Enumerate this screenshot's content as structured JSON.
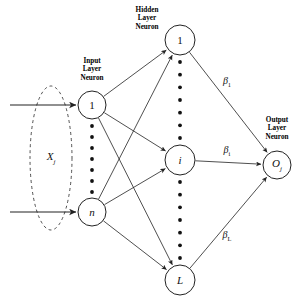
{
  "diagram": {
    "stroke_color": "#222222",
    "background": "#ffffff",
    "groups": [
      {
        "id": "input-layer",
        "label": "Input\nLayer\nNeuron",
        "x": 92,
        "y": 57
      },
      {
        "id": "hidden-layer",
        "label": "Hidden\nLayer\nNeuron",
        "x": 147,
        "y": 6
      },
      {
        "id": "output-layer",
        "label": "Output\nLayer\nNeuron",
        "x": 277,
        "y": 116
      }
    ],
    "input_nodes": [
      {
        "id": "input-node-1",
        "label": "1",
        "italic": false,
        "cx": 92,
        "cy": 105,
        "r": 14
      },
      {
        "id": "input-node-n",
        "label": "n",
        "italic": true,
        "cx": 92,
        "cy": 212,
        "r": 14
      }
    ],
    "hidden_nodes": [
      {
        "id": "hidden-node-1",
        "label": "1",
        "italic": false,
        "cx": 180,
        "cy": 40,
        "r": 15
      },
      {
        "id": "hidden-node-i",
        "label": "i",
        "italic": true,
        "cx": 180,
        "cy": 160,
        "r": 15
      },
      {
        "id": "hidden-node-L",
        "label": "L",
        "italic": true,
        "cx": 180,
        "cy": 280,
        "r": 15
      }
    ],
    "output_nodes": [
      {
        "id": "output-node-Oj",
        "label": "O",
        "sub": "j",
        "italic": true,
        "cx": 277,
        "cy": 165,
        "r": 14
      }
    ],
    "input_dots": {
      "count": 7,
      "cx": 92,
      "from_y": 126,
      "to_y": 192
    },
    "hidden_dots_upper": {
      "count": 7,
      "cx": 180,
      "from_y": 62,
      "to_y": 138
    },
    "hidden_dots_lower": {
      "count": 7,
      "cx": 180,
      "from_y": 182,
      "to_y": 258
    },
    "weights": [
      {
        "id": "beta-1",
        "base": "β",
        "sub": "1",
        "x": 227,
        "y": 81
      },
      {
        "id": "beta-i",
        "base": "β",
        "sub": "i",
        "x": 227,
        "y": 150
      },
      {
        "id": "beta-L",
        "base": "β",
        "sub": "L",
        "x": 227,
        "y": 235
      }
    ],
    "input_vector": {
      "id": "input-vector-Xj",
      "base": "X",
      "sub": "j",
      "x": 51,
      "y": 158
    },
    "input_arrows": [
      {
        "id": "input-arrow-top",
        "x1": 10,
        "y1": 105,
        "x2": 76,
        "y2": 105
      },
      {
        "id": "input-arrow-bottom",
        "x1": 10,
        "y1": 212,
        "x2": 76,
        "y2": 212
      }
    ],
    "ellipse": {
      "id": "input-grouping-ellipse",
      "cx": 51,
      "cy": 158,
      "rx": 21,
      "ry": 72,
      "dash": "3 3"
    }
  }
}
